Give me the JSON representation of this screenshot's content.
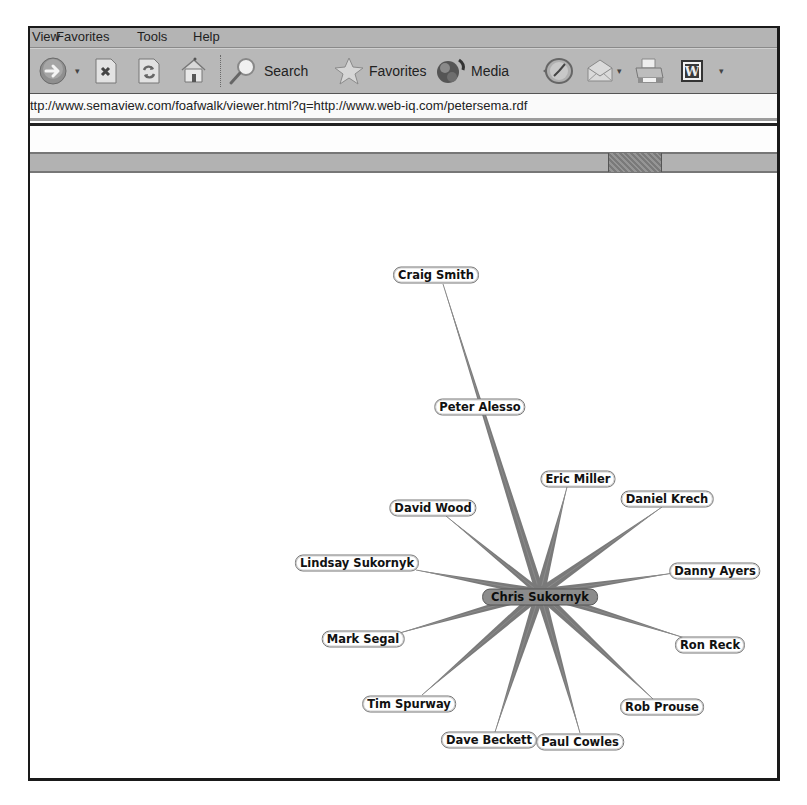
{
  "browser": {
    "menu": [
      {
        "label": "View",
        "x": 2
      },
      {
        "label": "Favorites",
        "x": 56
      },
      {
        "label": "Tools",
        "x": 137
      },
      {
        "label": "Help",
        "x": 193
      }
    ],
    "toolbar": {
      "back_icon": "back-arrow-icon",
      "stop_icon": "stop-icon",
      "refresh_icon": "refresh-icon",
      "home_icon": "home-icon",
      "search_label": "Search",
      "favorites_label": "Favorites",
      "media_label": "Media",
      "history_icon": "history-icon",
      "mail_icon": "mail-icon",
      "print_icon": "print-icon",
      "word_icon": "word-icon",
      "word_glyph": "W"
    },
    "address": "ttp://www.semaview.com/foafwalk/viewer.html?q=http://www.web-iq.com/petersema.rdf"
  },
  "graph": {
    "center": {
      "label": "Chris Sukornyk",
      "x": 540,
      "y": 595,
      "hub_x": 538,
      "hub_y": 591
    },
    "colors": {
      "edge": "#7a7a7a",
      "edge_line": "#8a8a8a",
      "center_fill": "#8c8c8c",
      "node_fill": "#ffffff"
    },
    "nodes": [
      {
        "label": "Craig Smith",
        "x": 436,
        "y": 273,
        "ex": 441,
        "ey": 282,
        "w": 9
      },
      {
        "label": "Peter Alesso",
        "x": 480,
        "y": 405,
        "ex": null,
        "ey": null,
        "w": 0
      },
      {
        "label": "Eric Miller",
        "x": 578,
        "y": 477,
        "ex": 565,
        "ey": 485,
        "w": 10
      },
      {
        "label": "Daniel Krech",
        "x": 667,
        "y": 497,
        "ex": 660,
        "ey": 505,
        "w": 10
      },
      {
        "label": "David Wood",
        "x": 433,
        "y": 506,
        "ex": 444,
        "ey": 514,
        "w": 7
      },
      {
        "label": "Lindsay Sukornyk",
        "x": 357,
        "y": 561,
        "ex": 414,
        "ey": 568,
        "w": 9
      },
      {
        "label": "Danny Ayers",
        "x": 715,
        "y": 569,
        "ex": 672,
        "ey": 571,
        "w": 9
      },
      {
        "label": "Mark Segal",
        "x": 363,
        "y": 637,
        "ex": 394,
        "ey": 632,
        "w": 9
      },
      {
        "label": "Ron Reck",
        "x": 710,
        "y": 643,
        "ex": 683,
        "ey": 636,
        "w": 9
      },
      {
        "label": "Tim Spurway",
        "x": 409,
        "y": 702,
        "ex": 420,
        "ey": 693,
        "w": 10
      },
      {
        "label": "Rob Prouse",
        "x": 662,
        "y": 705,
        "ex": 651,
        "ey": 697,
        "w": 10
      },
      {
        "label": "Dave Beckett",
        "x": 489,
        "y": 738,
        "ex": 493,
        "ey": 730,
        "w": 10
      },
      {
        "label": "Paul Cowles",
        "x": 580,
        "y": 740,
        "ex": 578,
        "ey": 731,
        "w": 10
      }
    ]
  }
}
